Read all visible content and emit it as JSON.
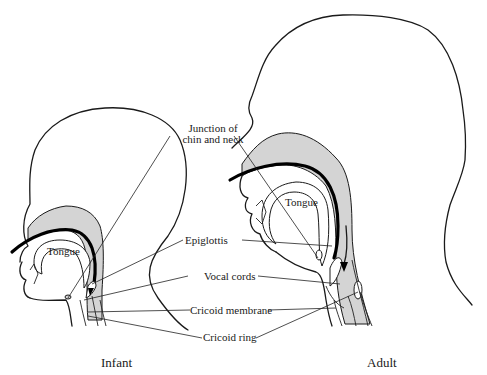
{
  "figure": {
    "panels": [
      {
        "id": "infant",
        "caption": "Infant"
      },
      {
        "id": "adult",
        "caption": "Adult"
      }
    ],
    "labels": {
      "junction": [
        "Junction of",
        "chin and neck"
      ],
      "epiglottis": "Epiglottis",
      "vocal_cords": "Vocal cords",
      "cricoid_membrane": "Cricoid membrane",
      "cricoid_ring": "Cricoid ring",
      "tongue_infant": "Tongue",
      "tongue_adult": "Tongue"
    },
    "colors": {
      "tissue_fill": "#d4d4d4",
      "line": "#1a1a1a",
      "background": "#ffffff"
    }
  }
}
